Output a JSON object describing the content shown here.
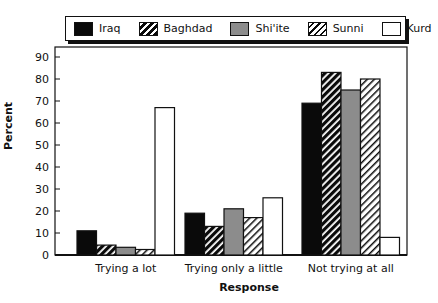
{
  "chart_data": {
    "type": "bar",
    "title": "",
    "xlabel": "Response",
    "ylabel": "Percent",
    "ylim": [
      0,
      90
    ],
    "yticks": [
      0,
      10,
      20,
      30,
      40,
      50,
      60,
      70,
      80,
      90
    ],
    "grid": false,
    "legend_position": "top",
    "categories": [
      "Trying a lot",
      "Trying only a little",
      "Not trying at all"
    ],
    "series": [
      {
        "name": "Iraq",
        "fill": "solid-black",
        "values": [
          11,
          19,
          69
        ]
      },
      {
        "name": "Baghdad",
        "fill": "black-hatch",
        "values": [
          4.5,
          13,
          83
        ]
      },
      {
        "name": "Shi'ite",
        "fill": "gray",
        "values": [
          3.5,
          21,
          75
        ]
      },
      {
        "name": "Sunni",
        "fill": "white-hatch",
        "values": [
          2.5,
          17,
          80
        ]
      },
      {
        "name": "Kurd",
        "fill": "white",
        "values": [
          67,
          26,
          8
        ]
      }
    ]
  },
  "legend": {
    "items": [
      "Iraq",
      "Baghdad",
      "Shi'ite",
      "Sunni",
      "Kurd"
    ]
  },
  "colors": {
    "black": "#0a0a0a",
    "gray": "#8c8c8c",
    "white": "#ffffff"
  }
}
